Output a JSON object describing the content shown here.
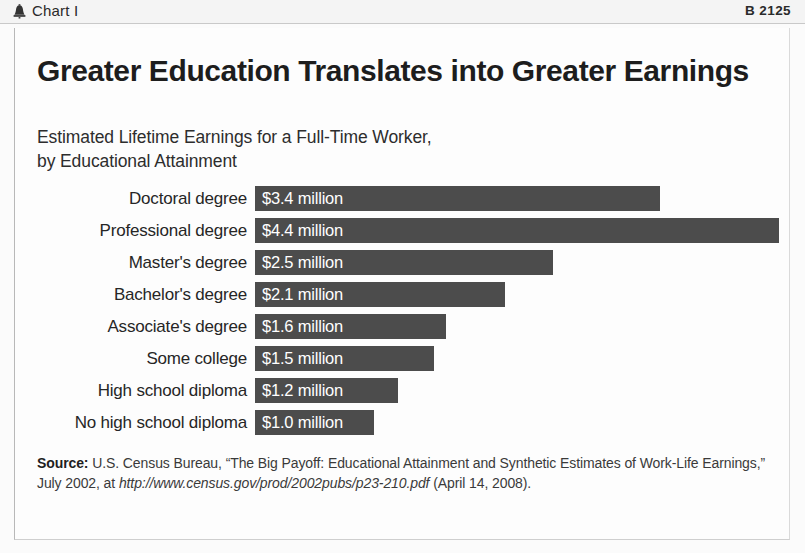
{
  "header": {
    "icon": "liberty-bell-icon",
    "label": "Chart I",
    "code": "B 2125"
  },
  "title": "Greater Education Translates into Greater Earnings",
  "subtitle": "Estimated Lifetime Earnings for a Full-Time Worker,\nby Educational Attainment",
  "chart_data": {
    "type": "bar",
    "orientation": "horizontal",
    "title": "Greater Education Translates into Greater Earnings",
    "subtitle": "Estimated Lifetime Earnings for a Full-Time Worker, by Educational Attainment",
    "xlabel": "",
    "ylabel": "",
    "unit": "million USD",
    "grid": false,
    "legend": false,
    "xlim": [
      0,
      4.4
    ],
    "categories": [
      "Doctoral degree",
      "Professional degree",
      "Master's degree",
      "Bachelor's degree",
      "Associate's degree",
      "Some college",
      "High school diploma",
      "No high school diploma"
    ],
    "values": [
      3.4,
      4.4,
      2.5,
      2.1,
      1.6,
      1.5,
      1.2,
      1.0
    ],
    "value_labels": [
      "$3.4 million",
      "$4.4 million",
      "$2.5 million",
      "$2.1 million",
      "$1.6 million",
      "$1.5 million",
      "$1.2 million",
      "$1.0 million"
    ],
    "bar_color": "#4c4c4c",
    "label_color": "#ffffff",
    "background": "#fdfdfd"
  },
  "source": {
    "label": "Source:",
    "text_before_url": " U.S. Census Bureau, “The Big Payoff: Educational Attainment and Synthetic Estimates of Work-Life Earnings,” July 2002, at ",
    "url": "http://www.census.gov/prod/2002pubs/p23-210.pdf",
    "text_after_url": " (April 14, 2008)."
  }
}
